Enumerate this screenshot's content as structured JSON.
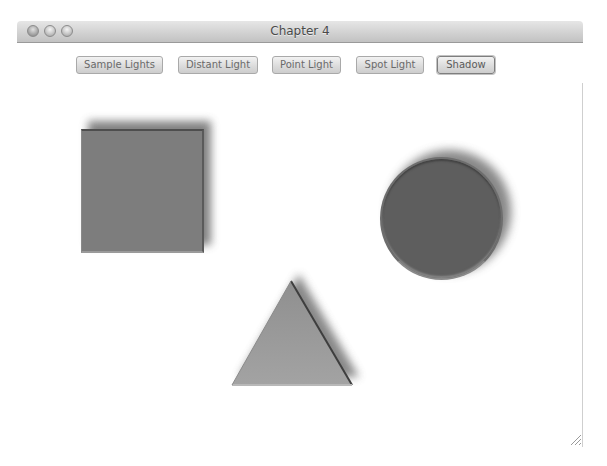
{
  "window": {
    "title": "Chapter 4",
    "controls": [
      "close",
      "minimize",
      "zoom"
    ]
  },
  "toolbar": {
    "buttons": [
      {
        "label": "Sample Lights",
        "default": false
      },
      {
        "label": "Distant Light",
        "default": false
      },
      {
        "label": "Point Light",
        "default": false
      },
      {
        "label": "Spot Light",
        "default": false
      },
      {
        "label": "Shadow",
        "default": true
      }
    ]
  },
  "canvas": {
    "effect": "Shadow",
    "shapes": [
      {
        "type": "square",
        "fill": "#7d7d7d"
      },
      {
        "type": "circle",
        "fill": "#5e5e5e"
      },
      {
        "type": "triangle",
        "fill": "#9a9a9a"
      }
    ],
    "shadow_color": "#6a6a6a"
  },
  "icons": {
    "close": "close-icon",
    "minimize": "minimize-icon",
    "zoom": "zoom-icon",
    "resize": "resize-grip-icon"
  }
}
